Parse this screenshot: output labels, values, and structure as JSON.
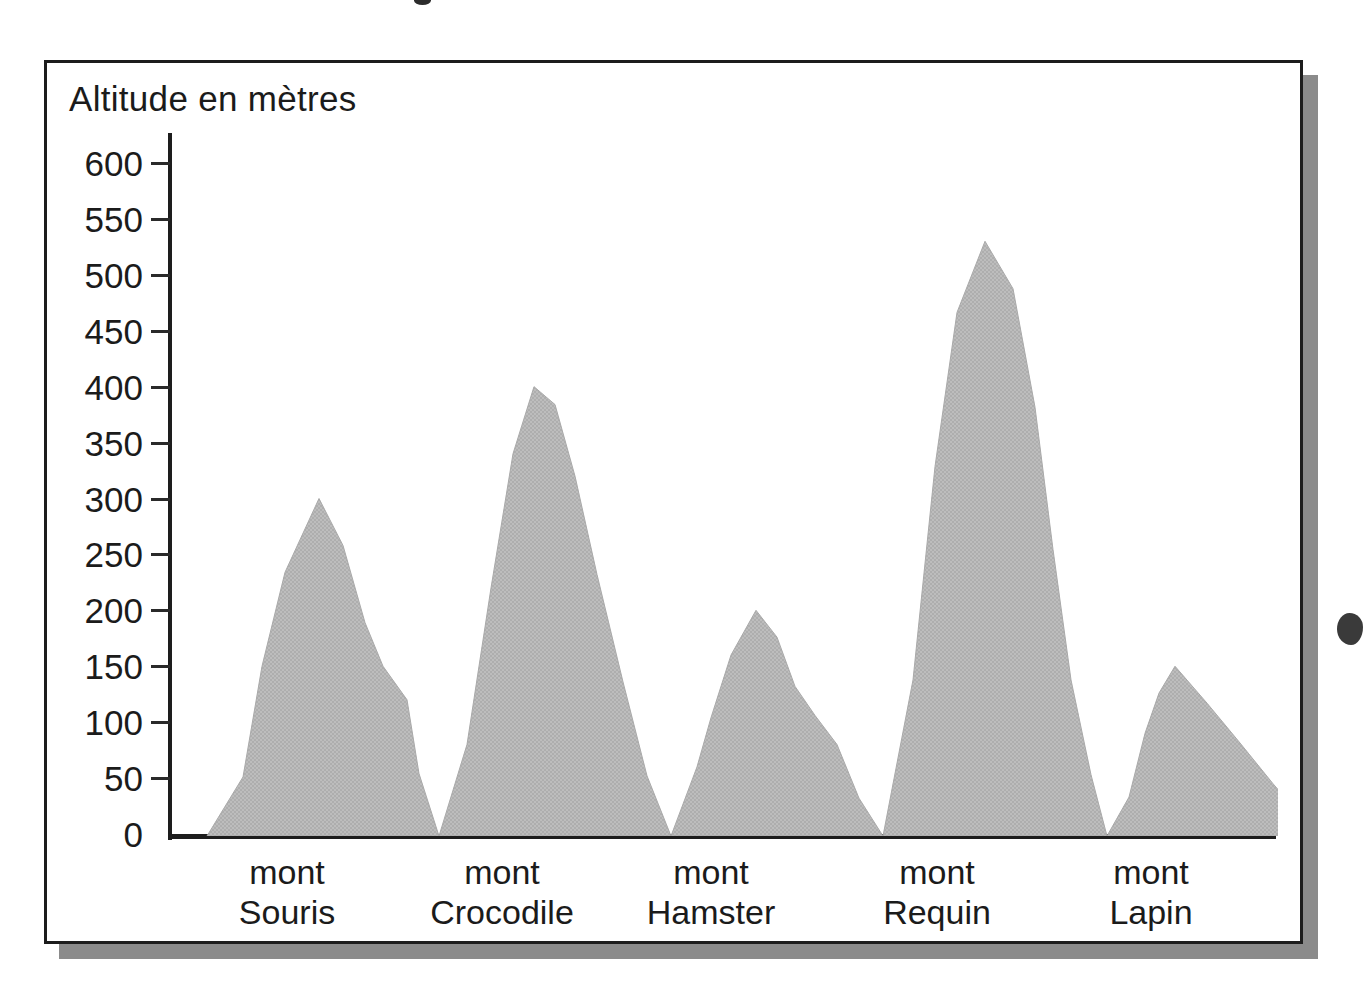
{
  "figure": {
    "frame_color": "#1d1d1d",
    "shadow_color": "#8b8b8b",
    "background": "#ffffff"
  },
  "chart_data": {
    "type": "area",
    "title": "Altitude en mètres",
    "xlabel": "",
    "ylabel": "Altitude en mètres",
    "ylim": [
      0,
      600
    ],
    "grid": false,
    "legend": null,
    "fill_color": "#b9b9b9",
    "outline_color": "#b0b0b0",
    "y_ticks": [
      600,
      550,
      500,
      450,
      400,
      350,
      300,
      250,
      200,
      150,
      100,
      50,
      0
    ],
    "y_tick_labels": [
      "600",
      "550",
      "500",
      "450",
      "400",
      "350",
      "300",
      "250",
      "200",
      "150",
      "100",
      "50",
      "0"
    ],
    "categories": [
      "mont Souris",
      "mont Crocodile",
      "mont Hamster",
      "mont Requin",
      "mont Lapin"
    ],
    "values": [
      300,
      400,
      200,
      530,
      150
    ],
    "category_labels": [
      {
        "line1": "mont",
        "line2": "Souris"
      },
      {
        "line1": "mont",
        "line2": "Crocodile"
      },
      {
        "line1": "mont",
        "line2": "Hamster"
      },
      {
        "line1": "mont",
        "line2": "Requin"
      },
      {
        "line1": "mont",
        "line2": "Lapin"
      }
    ],
    "profile_note": "Silhouette de massif : cinq sommets reliés par des vallées descendant au niveau 0",
    "peaks": [
      {
        "name": "mont Souris",
        "altitude": 300
      },
      {
        "name": "mont Crocodile",
        "altitude": 400
      },
      {
        "name": "mont Hamster",
        "altitude": 200
      },
      {
        "name": "mont Requin",
        "altitude": 530
      },
      {
        "name": "mont Lapin",
        "altitude": 150
      }
    ]
  },
  "artifacts": {
    "top_dot": "scan-speck",
    "right_blob": "scan-speck"
  }
}
